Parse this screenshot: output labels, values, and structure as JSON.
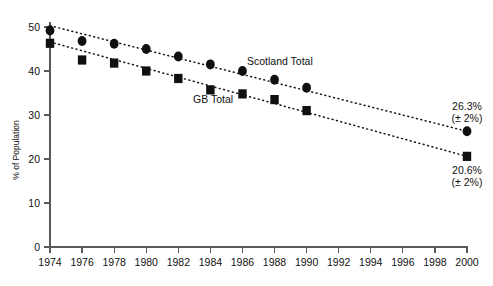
{
  "chart_data": {
    "type": "scatter",
    "title": "",
    "xlabel": "",
    "ylabel": "% of Population",
    "xlim": [
      1974,
      2000
    ],
    "ylim": [
      0,
      50
    ],
    "grid": false,
    "legend_position": "inline-annotations",
    "x": [
      1974,
      1976,
      1978,
      1980,
      1982,
      1984,
      1986,
      1988,
      1990,
      2000
    ],
    "xticks": [
      "1974",
      "1976",
      "1978",
      "1980",
      "1982",
      "1984",
      "1986",
      "1988",
      "1990",
      "1992",
      "1994",
      "1996",
      "1998",
      "2000"
    ],
    "xtick_values": [
      1974,
      1976,
      1978,
      1980,
      1982,
      1984,
      1986,
      1988,
      1990,
      1992,
      1994,
      1996,
      1998,
      2000
    ],
    "yticks": [
      "0",
      "10",
      "20",
      "30",
      "40",
      "50"
    ],
    "ytick_values": [
      0,
      10,
      20,
      30,
      40,
      50
    ],
    "series": [
      {
        "name": "Scotland Total",
        "marker": "circle",
        "color": "#101010",
        "values": [
          49.2,
          46.8,
          46.2,
          45.0,
          43.3,
          41.5,
          40.0,
          38.0,
          36.2,
          26.3
        ],
        "trend_start": [
          1974,
          50.3
        ],
        "trend_end": [
          2000,
          26.3
        ]
      },
      {
        "name": "GB Total",
        "marker": "square",
        "color": "#101010",
        "values": [
          46.3,
          42.5,
          41.8,
          40.0,
          38.3,
          35.7,
          34.8,
          33.5,
          31.0,
          20.6
        ],
        "trend_start": [
          1974,
          46.6
        ],
        "trend_end": [
          2000,
          20.6
        ]
      }
    ],
    "annotations": [
      {
        "id": "scotland-endpoint",
        "line1": "26.3%",
        "line2": "(± 2%)",
        "x": 2000,
        "y": 26.3
      },
      {
        "id": "gb-endpoint",
        "line1": "20.6%",
        "line2": "(± 2%)",
        "x": 2000,
        "y": 20.6
      }
    ],
    "series_labels": [
      {
        "id": "scotland-total-label",
        "text": "Scotland Total",
        "x_px": 247,
        "y_px": 65
      },
      {
        "id": "gb-total-label",
        "text": "GB Total",
        "x_px": 193,
        "y_px": 103
      }
    ]
  }
}
